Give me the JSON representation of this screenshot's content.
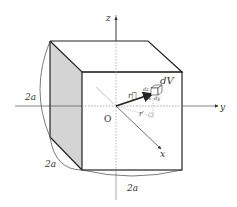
{
  "diagram": {
    "axes": {
      "z_label": "z",
      "y_label": "y",
      "x_label": "x",
      "origin_label": "O"
    },
    "vectors": {
      "r_label": "r⃗",
      "r_prime_label": "r′"
    },
    "volume_element": {
      "label": "dV",
      "dz_label": "dz",
      "dx_label": "dx",
      "dy_label": "dy"
    },
    "dimensions": {
      "height_label": "2a",
      "depth_label": "2a",
      "width_label": "2a"
    },
    "colors": {
      "shaded_face": "#d4d4d4",
      "edge": "#222222",
      "axis": "#555555",
      "dashed": "#888888"
    }
  }
}
